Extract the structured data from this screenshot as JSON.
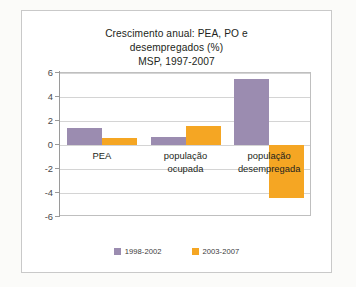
{
  "chart_data": {
    "type": "bar",
    "title": "Crescimento anual: PEA, PO e desempregados (%)\nMSP, 1997-2007",
    "title_lines": [
      "Crescimento anual: PEA, PO e",
      "desempregados (%)",
      "MSP, 1997-2007"
    ],
    "categories": [
      "PEA",
      "população ocupada",
      "população desempregada"
    ],
    "category_lines": [
      [
        "PEA"
      ],
      [
        "população",
        "ocupada"
      ],
      [
        "população",
        "desempregada"
      ]
    ],
    "series": [
      {
        "name": "1998-2002",
        "color": "#9b8cb0",
        "values": [
          1.4,
          0.7,
          5.5
        ]
      },
      {
        "name": "2003-2007",
        "color": "#f5a623",
        "values": [
          0.6,
          1.6,
          -4.4
        ]
      }
    ],
    "xlabel": "",
    "ylabel": "",
    "ylim": [
      -6,
      6
    ],
    "ytick_step": 2,
    "yticks": [
      6,
      4,
      2,
      0,
      -2,
      -4,
      -6
    ],
    "ytick_labels": [
      "6",
      "4",
      "2",
      "0",
      "-2",
      "-4",
      "-6"
    ],
    "grid": true,
    "grid_axis": "y",
    "legend_position": "bottom",
    "plot_background": "#ffffff",
    "grid_color": "#d4d4d4",
    "axis_color": "#9a9a9a",
    "text_color": "#231f20"
  },
  "legend": {
    "items": [
      {
        "label": "1998-2002",
        "color": "#9b8cb0"
      },
      {
        "label": "2003-2007",
        "color": "#f5a623"
      }
    ]
  }
}
